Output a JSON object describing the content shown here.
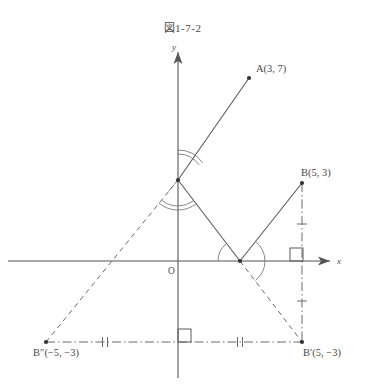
{
  "figure": {
    "title": "図1-7-2",
    "axes": {
      "x_label": "x",
      "y_label": "y",
      "origin_label": "O",
      "x_axis_color": "#555555",
      "y_axis_color": "#555555"
    },
    "points": [
      {
        "name": "A",
        "label": "A(3, 7)",
        "x": 3,
        "y": 7,
        "px": 249,
        "py": 78,
        "label_x": 256,
        "label_y": 72,
        "anchor": "start"
      },
      {
        "name": "B",
        "label": "B(5, 3)",
        "x": 5,
        "y": 3,
        "px": 302,
        "py": 183,
        "label_x": 301,
        "label_y": 176,
        "anchor": "start"
      },
      {
        "name": "Bp",
        "label": "B′(5, −3)",
        "x": 5,
        "y": -3,
        "px": 302,
        "py": 342,
        "label_x": 303,
        "label_y": 356,
        "anchor": "start"
      },
      {
        "name": "Bpp",
        "label": "B″(−5, −3)",
        "x": -5,
        "y": -3,
        "px": 46,
        "py": 342,
        "label_x": 33,
        "label_y": 356,
        "anchor": "start"
      },
      {
        "name": "Q",
        "label": "",
        "x": 0,
        "y": 3.1,
        "px": 178,
        "py": 180,
        "label_x": 0,
        "label_y": 0,
        "anchor": "start"
      },
      {
        "name": "P",
        "label": "",
        "x": 2.5,
        "y": 0,
        "px": 240,
        "py": 261,
        "label_x": 0,
        "label_y": 0,
        "anchor": "start"
      }
    ],
    "solid_segments": [
      {
        "name": "segment-A-Q",
        "x1": 249,
        "y1": 78,
        "x2": 178,
        "y2": 180
      },
      {
        "name": "segment-Q-P",
        "x1": 178,
        "y1": 180,
        "x2": 240,
        "y2": 261
      },
      {
        "name": "segment-P-B",
        "x1": 240,
        "y1": 261,
        "x2": 302,
        "y2": 183
      }
    ],
    "dashed_segments": [
      {
        "name": "segment-Bpp-Q",
        "x1": 46,
        "y1": 342,
        "x2": 178,
        "y2": 180
      },
      {
        "name": "segment-Q-up",
        "x1": 178,
        "y1": 180,
        "x2": 167,
        "y2": 193
      },
      {
        "name": "segment-P-Bp",
        "x1": 240,
        "y1": 261,
        "x2": 302,
        "y2": 342
      }
    ],
    "dashdot_segments": [
      {
        "name": "baseline-Bpp-Bp",
        "x1": 46,
        "y1": 342,
        "x2": 302,
        "y2": 342
      },
      {
        "name": "vertical-B-Bp",
        "x1": 302,
        "y1": 183,
        "x2": 302,
        "y2": 342
      }
    ],
    "tick_marks": [
      {
        "name": "tick-base-left",
        "cx": 105,
        "cy": 342,
        "kind": "double",
        "orient": "vertical"
      },
      {
        "name": "tick-base-right",
        "cx": 240,
        "cy": 342,
        "kind": "double",
        "orient": "vertical"
      },
      {
        "name": "tick-vert-upper",
        "cx": 302,
        "cy": 224,
        "kind": "single",
        "orient": "horizontal"
      },
      {
        "name": "tick-vert-lower",
        "cx": 302,
        "cy": 301,
        "kind": "single",
        "orient": "horizontal"
      }
    ],
    "right_angles": [
      {
        "name": "right-angle-at-x-axis",
        "x": 290,
        "y": 248,
        "size": 13
      },
      {
        "name": "right-angle-at-baseline",
        "x": 178,
        "y": 329,
        "size": 13
      }
    ],
    "angle_arcs": [
      {
        "name": "angle-arc-Q-upper-1",
        "cx": 178,
        "cy": 180,
        "r": 26,
        "a1": -90,
        "a2": -35
      },
      {
        "name": "angle-arc-Q-upper-2",
        "cx": 178,
        "cy": 180,
        "r": 30,
        "a1": -90,
        "a2": -35
      },
      {
        "name": "angle-arc-Q-lower-1",
        "cx": 178,
        "cy": 180,
        "r": 26,
        "a1": 52,
        "a2": 129
      },
      {
        "name": "angle-arc-Q-lower-2",
        "cx": 178,
        "cy": 180,
        "r": 30,
        "a1": 52,
        "a2": 129
      },
      {
        "name": "angle-arc-P-left",
        "cx": 240,
        "cy": 261,
        "r": 22,
        "a1": 180,
        "a2": 232
      },
      {
        "name": "angle-arc-P-right",
        "cx": 240,
        "cy": 261,
        "r": 25,
        "a1": -52,
        "a2": 52
      }
    ],
    "styles": {
      "line_color": "#5a5a5a",
      "dash_color": "#6a6a6a",
      "arc_color": "#7a7a7a",
      "point_color": "#333333",
      "tick_color": "#6a6a6a"
    }
  }
}
